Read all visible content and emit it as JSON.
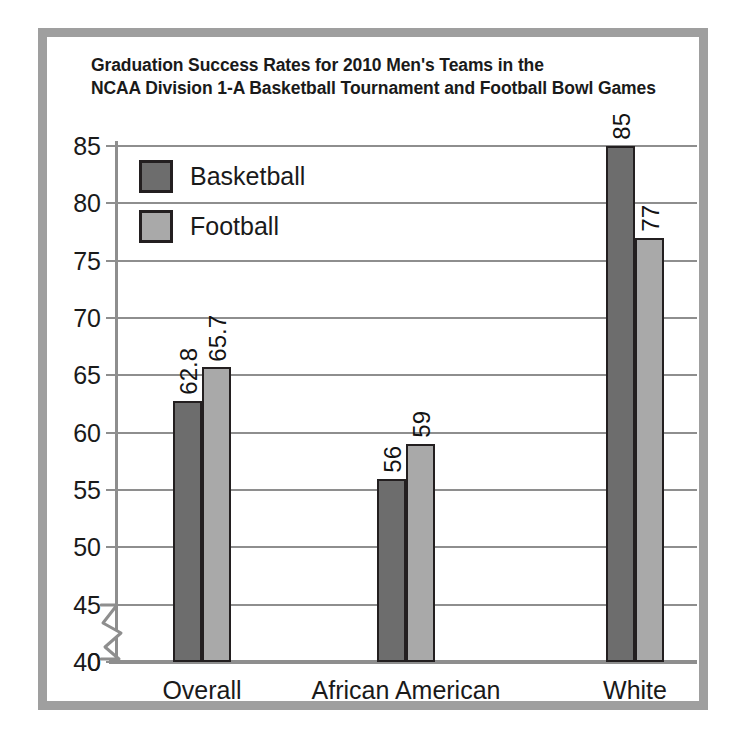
{
  "chart_data": {
    "type": "bar",
    "title": "Graduation Success Rates for 2010 Men's Teams in the\nNCAA Division 1-A Basketball Tournament and Football Bowl Games",
    "title_line1": "Graduation Success Rates for 2010 Men's Teams in the",
    "title_line2": "NCAA Division 1-A Basketball Tournament and Football Bowl Games",
    "categories": [
      "Overall",
      "African American",
      "White"
    ],
    "series": [
      {
        "name": "Basketball",
        "color": "#6d6d6d",
        "values": [
          62.8,
          56,
          85
        ],
        "labels": [
          "62.8",
          "56",
          "85"
        ]
      },
      {
        "name": "Football",
        "color": "#a9a9a9",
        "values": [
          65.7,
          59,
          77
        ],
        "labels": [
          "65.7",
          "59",
          "77"
        ]
      }
    ],
    "xlabel": "",
    "ylabel": "",
    "ylim": [
      40,
      85
    ],
    "yticks": [
      40,
      45,
      50,
      55,
      60,
      65,
      70,
      75,
      80,
      85
    ],
    "ytick_labels": [
      "40",
      "45",
      "50",
      "55",
      "60",
      "65",
      "70",
      "75",
      "80",
      "85"
    ],
    "axis_origin_label": "0",
    "axis_break": true,
    "grid": true,
    "legend_position": "upper-left-inside"
  },
  "style": {
    "frame_color": "#9f9f9f",
    "axis_color": "#8e8e8e",
    "text_color": "#1a1a1a",
    "bar_outline": "#231f20",
    "background": "#ffffff"
  }
}
